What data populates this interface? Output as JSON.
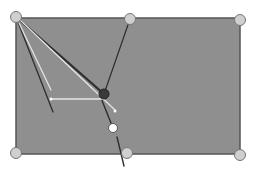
{
  "canvas": {
    "width": 259,
    "height": 179,
    "background": "#ffffff"
  },
  "colors": {
    "rect_fill": "#8f8f8f",
    "rect_stroke": "#555555",
    "vertex_fill": "#cfcfcf",
    "vertex_stroke": "#777777",
    "dark_line": "#2e2e2e",
    "light_line": "#e8e8e8",
    "dark_point": "#3a3a3a",
    "white_point": "#ffffff"
  },
  "rectangle": {
    "x": 16,
    "y": 18,
    "width": 224,
    "height": 136
  },
  "vertices": [
    {
      "name": "top-left",
      "x": 16,
      "y": 17
    },
    {
      "name": "top-mid",
      "x": 130,
      "y": 19
    },
    {
      "name": "top-right",
      "x": 240,
      "y": 20
    },
    {
      "name": "bottom-left",
      "x": 16,
      "y": 153
    },
    {
      "name": "bottom-mid",
      "x": 127,
      "y": 153
    },
    {
      "name": "bottom-right",
      "x": 240,
      "y": 155
    }
  ],
  "lines": [
    {
      "name": "tl-to-lower-left",
      "x1": 16,
      "y1": 17,
      "x2": 53,
      "y2": 112,
      "kind": "dark",
      "w": 1.3
    },
    {
      "name": "tl-to-dark-point",
      "x1": 16,
      "y1": 17,
      "x2": 104,
      "y2": 94,
      "kind": "dark",
      "w": 2.2
    },
    {
      "name": "tl-light",
      "x1": 19,
      "y1": 23,
      "x2": 51,
      "y2": 90,
      "kind": "light",
      "w": 1.2
    },
    {
      "name": "tl-to-light-end",
      "x1": 19,
      "y1": 19,
      "x2": 115,
      "y2": 110,
      "kind": "light",
      "w": 1.2
    },
    {
      "name": "topmid-to-dark-point",
      "x1": 130,
      "y1": 19,
      "x2": 104,
      "y2": 94,
      "kind": "dark",
      "w": 1.2
    },
    {
      "name": "dark-to-white-point",
      "x1": 101,
      "y1": 98,
      "x2": 113,
      "y2": 128,
      "kind": "dark",
      "w": 1.4
    },
    {
      "name": "lower-tail",
      "x1": 117,
      "y1": 137,
      "x2": 124,
      "y2": 166,
      "kind": "dark",
      "w": 1.4
    },
    {
      "name": "horizontal-vector",
      "x1": 51,
      "y1": 99,
      "x2": 103,
      "y2": 99,
      "kind": "light",
      "w": 1.4
    }
  ],
  "points": [
    {
      "name": "dark-point",
      "x": 104,
      "y": 94,
      "r": 5,
      "kind": "dark"
    },
    {
      "name": "white-point",
      "x": 113,
      "y": 128,
      "r": 4.5,
      "kind": "white"
    },
    {
      "name": "vector-tail-dot",
      "x": 51,
      "y": 99,
      "r": 1.5,
      "kind": "white"
    },
    {
      "name": "light-end-dot",
      "x": 115,
      "y": 111,
      "r": 1.5,
      "kind": "white"
    }
  ]
}
